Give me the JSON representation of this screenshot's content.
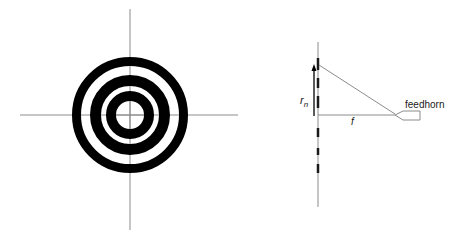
{
  "diagram": {
    "left_panel": {
      "name": "fresnel-zone-plate",
      "center": [
        130,
        115
      ],
      "axes": {
        "horizontal": {
          "x1": 20,
          "x2": 238,
          "y": 115
        },
        "vertical": {
          "x": 130,
          "y1": 9,
          "y2": 230
        },
        "color": "#8c8c8c"
      },
      "rings": [
        {
          "r_outer": 58,
          "r_inner": 49,
          "fill": "#000000"
        },
        {
          "r_outer": 40,
          "r_inner": 29,
          "fill": "#000000"
        },
        {
          "r_outer": 24,
          "r_inner": 14,
          "fill": "#000000"
        }
      ]
    },
    "right_panel": {
      "name": "zone-plate-side-view",
      "plate_line": {
        "x": 318,
        "y1": 42,
        "y2": 207,
        "color": "#8c8c8c"
      },
      "plate_dashes": [
        {
          "y1": 58,
          "y2": 70
        },
        {
          "y1": 78,
          "y2": 88
        },
        {
          "y1": 96,
          "y2": 108
        },
        {
          "y1": 128,
          "y2": 137
        },
        {
          "y1": 148,
          "y2": 155
        },
        {
          "y1": 164,
          "y2": 173
        }
      ],
      "radius_arrow": {
        "x": 314,
        "y_base": 116,
        "y_tip": 64
      },
      "ray_diagonal": {
        "x1": 319,
        "y1": 65,
        "x2": 395,
        "y2": 114
      },
      "ray_axis": {
        "x1": 318,
        "y1": 115,
        "x2": 395,
        "y2": 115
      },
      "labels": {
        "radius": "r",
        "radius_subscript": "n",
        "focal_length": "f",
        "feedhorn": "feedhorn"
      }
    }
  }
}
